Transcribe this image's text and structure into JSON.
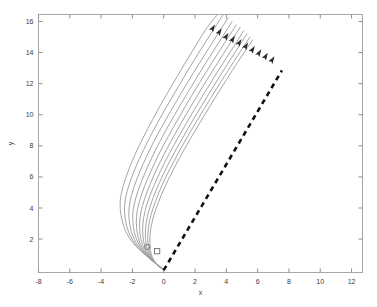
{
  "chart_data": {
    "type": "line",
    "title": "",
    "xlabel": "x",
    "ylabel": "y",
    "xlim": [
      -8,
      12.7
    ],
    "ylim": [
      -0.15,
      16.45
    ],
    "xticks": [
      -8,
      -6,
      -4,
      -2,
      0,
      2,
      4,
      6,
      8,
      10,
      12
    ],
    "xticklabels": [
      "-8",
      "-6",
      "-4",
      "-2",
      "0",
      "2",
      "4",
      "6",
      "8",
      "10",
      "12"
    ],
    "yticks": [
      2,
      4,
      6,
      8,
      10,
      12,
      14,
      16
    ],
    "yticklabels": [
      "2",
      "4",
      "6",
      "8",
      "10",
      "12",
      "14",
      "16"
    ],
    "grid": false,
    "legend": "none",
    "background_color": "#ffffff",
    "frame_color": "#a8a8a8",
    "trajectory_color": "#9a9a9a",
    "dashed_line_color": "#111111",
    "arrow_color": "#2b2b2b",
    "series": [
      {
        "name": "trajectory-1",
        "style": "solid",
        "points": [
          [
            0.0,
            0.0
          ],
          [
            -0.3,
            0.28
          ],
          [
            -0.72,
            0.62
          ],
          [
            -1.25,
            1.05
          ],
          [
            -1.92,
            1.7
          ],
          [
            -2.45,
            2.55
          ],
          [
            -2.72,
            3.5
          ],
          [
            -2.78,
            4.4
          ],
          [
            -2.62,
            5.3
          ],
          [
            -2.3,
            6.3
          ],
          [
            -1.85,
            7.4
          ],
          [
            -1.3,
            8.55
          ],
          [
            -0.7,
            9.7
          ],
          [
            -0.05,
            10.9
          ],
          [
            0.62,
            12.05
          ],
          [
            1.32,
            13.25
          ],
          [
            2.05,
            14.45
          ],
          [
            2.8,
            15.65
          ],
          [
            3.4,
            16.4
          ]
        ],
        "arrow_at": [
          3.12,
          15.55
        ],
        "arrow_angle_deg": 58
      },
      {
        "name": "trajectory-2",
        "style": "solid",
        "points": [
          [
            0.0,
            0.0
          ],
          [
            -0.28,
            0.25
          ],
          [
            -0.66,
            0.56
          ],
          [
            -1.12,
            0.95
          ],
          [
            -1.72,
            1.55
          ],
          [
            -2.2,
            2.35
          ],
          [
            -2.45,
            3.25
          ],
          [
            -2.5,
            4.15
          ],
          [
            -2.34,
            5.05
          ],
          [
            -2.02,
            6.05
          ],
          [
            -1.57,
            7.12
          ],
          [
            -1.04,
            8.25
          ],
          [
            -0.44,
            9.4
          ],
          [
            0.22,
            10.58
          ],
          [
            0.9,
            11.75
          ],
          [
            1.6,
            12.95
          ],
          [
            2.34,
            14.15
          ],
          [
            3.1,
            15.35
          ],
          [
            3.8,
            16.45
          ]
        ],
        "arrow_at": [
          3.55,
          15.32
        ],
        "arrow_angle_deg": 58
      },
      {
        "name": "trajectory-3",
        "style": "solid",
        "points": [
          [
            0.0,
            0.0
          ],
          [
            -0.26,
            0.23
          ],
          [
            -0.6,
            0.5
          ],
          [
            -1.0,
            0.86
          ],
          [
            -1.53,
            1.42
          ],
          [
            -1.96,
            2.16
          ],
          [
            -2.18,
            3.02
          ],
          [
            -2.22,
            3.92
          ],
          [
            -2.06,
            4.82
          ],
          [
            -1.74,
            5.8
          ],
          [
            -1.3,
            6.86
          ],
          [
            -0.78,
            7.98
          ],
          [
            -0.18,
            9.12
          ],
          [
            0.47,
            10.28
          ],
          [
            1.15,
            11.45
          ],
          [
            1.86,
            12.64
          ],
          [
            2.6,
            13.84
          ],
          [
            3.36,
            15.04
          ],
          [
            4.12,
            16.25
          ]
        ],
        "arrow_at": [
          3.98,
          15.02
        ],
        "arrow_angle_deg": 58
      },
      {
        "name": "trajectory-4",
        "style": "solid",
        "points": [
          [
            0.0,
            0.0
          ],
          [
            -0.24,
            0.21
          ],
          [
            -0.55,
            0.45
          ],
          [
            -0.9,
            0.78
          ],
          [
            -1.36,
            1.3
          ],
          [
            -1.74,
            1.98
          ],
          [
            -1.94,
            2.8
          ],
          [
            -1.97,
            3.68
          ],
          [
            -1.8,
            4.58
          ],
          [
            -1.48,
            5.56
          ],
          [
            -1.05,
            6.6
          ],
          [
            -0.53,
            7.72
          ],
          [
            0.06,
            8.85
          ],
          [
            0.7,
            10.0
          ],
          [
            1.38,
            11.17
          ],
          [
            2.09,
            12.36
          ],
          [
            2.83,
            13.56
          ],
          [
            3.59,
            14.76
          ],
          [
            4.38,
            16.0
          ]
        ],
        "arrow_at": [
          4.4,
          14.84
        ],
        "arrow_angle_deg": 58
      },
      {
        "name": "trajectory-5",
        "style": "solid",
        "points": [
          [
            0.0,
            0.0
          ],
          [
            -0.22,
            0.19
          ],
          [
            -0.5,
            0.41
          ],
          [
            -0.81,
            0.71
          ],
          [
            -1.21,
            1.18
          ],
          [
            -1.55,
            1.82
          ],
          [
            -1.72,
            2.6
          ],
          [
            -1.74,
            3.46
          ],
          [
            -1.57,
            4.36
          ],
          [
            -1.25,
            5.33
          ],
          [
            -0.82,
            6.36
          ],
          [
            -0.31,
            7.46
          ],
          [
            0.28,
            8.58
          ],
          [
            0.92,
            9.73
          ],
          [
            1.59,
            10.9
          ],
          [
            2.3,
            12.08
          ],
          [
            3.04,
            13.28
          ],
          [
            3.8,
            14.48
          ],
          [
            4.64,
            15.8
          ]
        ],
        "arrow_at": [
          4.82,
          14.62
        ],
        "arrow_angle_deg": 58
      },
      {
        "name": "trajectory-6",
        "style": "solid",
        "points": [
          [
            0.0,
            0.0
          ],
          [
            -0.2,
            0.17
          ],
          [
            -0.45,
            0.37
          ],
          [
            -0.73,
            0.64
          ],
          [
            -1.07,
            1.06
          ],
          [
            -1.37,
            1.66
          ],
          [
            -1.52,
            2.4
          ],
          [
            -1.53,
            3.24
          ],
          [
            -1.36,
            4.14
          ],
          [
            -1.04,
            5.1
          ],
          [
            -0.62,
            6.12
          ],
          [
            -0.11,
            7.2
          ],
          [
            0.48,
            8.32
          ],
          [
            1.11,
            9.46
          ],
          [
            1.78,
            10.62
          ],
          [
            2.49,
            11.8
          ],
          [
            3.23,
            13.0
          ],
          [
            3.99,
            14.2
          ],
          [
            4.9,
            15.65
          ]
        ],
        "arrow_at": [
          5.24,
          14.4
        ],
        "arrow_angle_deg": 58
      },
      {
        "name": "trajectory-7",
        "style": "solid",
        "points": [
          [
            0.0,
            0.0
          ],
          [
            -0.18,
            0.15
          ],
          [
            -0.4,
            0.33
          ],
          [
            -0.65,
            0.57
          ],
          [
            -0.94,
            0.95
          ],
          [
            -1.2,
            1.5
          ],
          [
            -1.33,
            2.21
          ],
          [
            -1.33,
            3.03
          ],
          [
            -1.16,
            3.92
          ],
          [
            -0.85,
            4.88
          ],
          [
            -0.43,
            5.88
          ],
          [
            0.07,
            6.95
          ],
          [
            0.66,
            8.06
          ],
          [
            1.29,
            9.19
          ],
          [
            1.96,
            10.34
          ],
          [
            2.67,
            11.52
          ],
          [
            3.41,
            12.72
          ],
          [
            4.17,
            13.92
          ],
          [
            5.12,
            15.42
          ]
        ],
        "arrow_at": [
          5.66,
          14.18
        ],
        "arrow_angle_deg": 58
      },
      {
        "name": "trajectory-8",
        "style": "solid",
        "points": [
          [
            0.0,
            0.0
          ],
          [
            -0.16,
            0.14
          ],
          [
            -0.36,
            0.3
          ],
          [
            -0.58,
            0.51
          ],
          [
            -0.83,
            0.85
          ],
          [
            -1.05,
            1.36
          ],
          [
            -1.16,
            2.04
          ],
          [
            -1.15,
            2.84
          ],
          [
            -0.98,
            3.72
          ],
          [
            -0.67,
            4.67
          ],
          [
            -0.26,
            5.66
          ],
          [
            0.24,
            6.72
          ],
          [
            0.82,
            7.82
          ],
          [
            1.45,
            8.94
          ],
          [
            2.12,
            10.09
          ],
          [
            2.83,
            11.26
          ],
          [
            3.57,
            12.46
          ],
          [
            4.33,
            13.66
          ],
          [
            5.33,
            15.22
          ]
        ],
        "arrow_at": [
          6.08,
          13.96
        ],
        "arrow_angle_deg": 58
      },
      {
        "name": "trajectory-9",
        "style": "solid",
        "points": [
          [
            0.0,
            0.0
          ],
          [
            -0.14,
            0.12
          ],
          [
            -0.32,
            0.26
          ],
          [
            -0.51,
            0.45
          ],
          [
            -0.73,
            0.76
          ],
          [
            -0.92,
            1.22
          ],
          [
            -1.01,
            1.88
          ],
          [
            -0.99,
            2.66
          ],
          [
            -0.82,
            3.53
          ],
          [
            -0.51,
            4.47
          ],
          [
            -0.11,
            5.46
          ],
          [
            0.39,
            6.5
          ],
          [
            0.96,
            7.59
          ],
          [
            1.59,
            8.71
          ],
          [
            2.26,
            9.85
          ],
          [
            2.97,
            11.02
          ],
          [
            3.71,
            12.21
          ],
          [
            4.47,
            13.41
          ],
          [
            5.52,
            15.02
          ]
        ],
        "arrow_at": [
          6.5,
          13.74
        ],
        "arrow_angle_deg": 58
      },
      {
        "name": "trajectory-10",
        "style": "solid",
        "points": [
          [
            0.0,
            0.0
          ],
          [
            -0.12,
            0.1
          ],
          [
            -0.28,
            0.23
          ],
          [
            -0.45,
            0.4
          ],
          [
            -0.64,
            0.68
          ],
          [
            -0.81,
            1.1
          ],
          [
            -0.88,
            1.73
          ],
          [
            -0.85,
            2.49
          ],
          [
            -0.68,
            3.35
          ],
          [
            -0.37,
            4.28
          ],
          [
            0.03,
            5.26
          ],
          [
            0.52,
            6.29
          ],
          [
            1.09,
            7.37
          ],
          [
            1.72,
            8.48
          ],
          [
            2.39,
            9.62
          ],
          [
            3.09,
            10.78
          ],
          [
            3.83,
            11.97
          ],
          [
            4.59,
            13.17
          ],
          [
            5.7,
            14.84
          ]
        ],
        "arrow_at": [
          6.92,
          13.52
        ],
        "arrow_angle_deg": 58
      }
    ],
    "dashed_series": {
      "name": "reference-dashed-line",
      "style": "dashed",
      "points": [
        [
          0.0,
          0.0
        ],
        [
          7.55,
          12.85
        ]
      ]
    },
    "markers": [
      {
        "name": "circle-marker",
        "shape": "circle",
        "x": -1.05,
        "y": 1.5
      },
      {
        "name": "square-marker",
        "shape": "square",
        "x": -0.42,
        "y": 1.22
      }
    ]
  }
}
